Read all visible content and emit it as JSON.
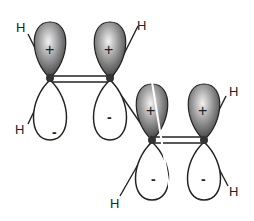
{
  "diagram": {
    "type": "p-orbital overlap (conjugated diene, butadiene pi system)",
    "atoms": [
      {
        "id": "C1",
        "top_lobe_sign": "+",
        "bottom_lobe_sign": "-"
      },
      {
        "id": "C2",
        "top_lobe_sign": "+",
        "bottom_lobe_sign": "-"
      },
      {
        "id": "C3",
        "top_lobe_sign": "+",
        "bottom_lobe_sign": "-"
      },
      {
        "id": "C4",
        "top_lobe_sign": "+",
        "bottom_lobe_sign": "-"
      }
    ],
    "labels": {
      "h1": "H",
      "h2": "H",
      "h3": "H",
      "h4": "H",
      "h5": "H",
      "h6": "H",
      "plus1": "+",
      "plus2": "+",
      "plus3": "+",
      "plus4": "+",
      "minus1": "-",
      "minus2": "-",
      "minus3": "-",
      "minus4": "-"
    },
    "colors": {
      "lobe_shaded_dark": "#3a3a3a",
      "lobe_shaded_light": "#e8e8e8",
      "line": "#222222",
      "background": "#ffffff"
    }
  }
}
